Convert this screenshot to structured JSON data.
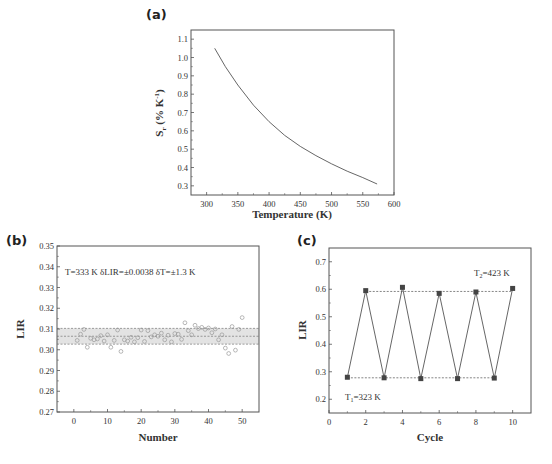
{
  "chart_data": [
    {
      "panel": "(a)",
      "type": "line",
      "title": "",
      "xlabel": "Temperature (K)",
      "ylabel": "S_r (% K^-1)",
      "xlim": [
        275,
        600
      ],
      "ylim": [
        0.25,
        1.15
      ],
      "xticks": [
        300,
        350,
        400,
        450,
        500,
        550,
        600
      ],
      "yticks": [
        0.3,
        0.4,
        0.5,
        0.6,
        0.7,
        0.8,
        0.9,
        1.0,
        1.1
      ],
      "grid": false,
      "series": [
        {
          "name": "Sr",
          "x": [
            313,
            330,
            350,
            375,
            400,
            425,
            450,
            475,
            500,
            525,
            550,
            573
          ],
          "values": [
            1.05,
            0.95,
            0.85,
            0.74,
            0.65,
            0.575,
            0.515,
            0.465,
            0.42,
            0.38,
            0.345,
            0.31
          ]
        }
      ]
    },
    {
      "panel": "(b)",
      "type": "scatter",
      "title": "",
      "xlabel": "Number",
      "ylabel": "LIR",
      "xlim": [
        -5,
        55
      ],
      "ylim": [
        0.27,
        0.35
      ],
      "xticks": [
        0,
        10,
        20,
        30,
        40,
        50
      ],
      "yticks": [
        0.27,
        0.28,
        0.29,
        0.3,
        0.31,
        0.32,
        0.33,
        0.34,
        0.35
      ],
      "grid": false,
      "annotation": "T=333 K δLIR=±0.0038 δT=±1.3 K",
      "band": {
        "mean": 0.3065,
        "upper": 0.3103,
        "lower": 0.3027
      },
      "series": [
        {
          "name": "LIR",
          "x": [
            1,
            2,
            3,
            4,
            5,
            6,
            7,
            8,
            9,
            10,
            11,
            12,
            13,
            14,
            15,
            16,
            17,
            18,
            19,
            20,
            21,
            22,
            23,
            24,
            25,
            26,
            27,
            28,
            29,
            30,
            31,
            32,
            33,
            34,
            35,
            36,
            37,
            38,
            39,
            40,
            41,
            42,
            43,
            44,
            45,
            46,
            47,
            48,
            49,
            50
          ],
          "values": [
            0.3045,
            0.3075,
            0.3098,
            0.3012,
            0.3055,
            0.3048,
            0.3052,
            0.3068,
            0.3042,
            0.3072,
            0.3012,
            0.3045,
            0.3095,
            0.2992,
            0.3048,
            0.3042,
            0.306,
            0.3038,
            0.3058,
            0.3095,
            0.304,
            0.3092,
            0.3062,
            0.3072,
            0.3065,
            0.308,
            0.3048,
            0.307,
            0.3038,
            0.3078,
            0.3075,
            0.305,
            0.313,
            0.3092,
            0.3072,
            0.3118,
            0.3102,
            0.3108,
            0.3098,
            0.3105,
            0.3082,
            0.31,
            0.3048,
            0.3072,
            0.3008,
            0.2982,
            0.3112,
            0.2998,
            0.3098,
            0.3155
          ]
        }
      ]
    },
    {
      "panel": "(c)",
      "type": "line",
      "title": "",
      "xlabel": "Cycle",
      "ylabel": "LIR",
      "xlim": [
        0,
        11
      ],
      "ylim": [
        0.15,
        0.75
      ],
      "xticks": [
        0,
        2,
        4,
        6,
        8,
        10
      ],
      "yticks": [
        0.2,
        0.3,
        0.4,
        0.5,
        0.6,
        0.7
      ],
      "grid": false,
      "annotations": [
        "T2=423 K",
        "T1=323 K"
      ],
      "reference_lines": [
        0.592,
        0.278
      ],
      "series": [
        {
          "name": "LIR cycling",
          "x": [
            1,
            2,
            3,
            4,
            5,
            6,
            7,
            8,
            9,
            10
          ],
          "values": [
            0.28,
            0.595,
            0.278,
            0.607,
            0.275,
            0.585,
            0.275,
            0.59,
            0.277,
            0.603
          ]
        }
      ]
    }
  ],
  "panels": {
    "a": {
      "label": "(a)",
      "xlabel": "Temperature (K)",
      "ylabel_main": "S",
      "ylabel_sub": "r",
      "ylabel_rest": " (% K",
      "ylabel_sup": "-1",
      "ylabel_close": ")",
      "xticks": [
        "300",
        "350",
        "400",
        "450",
        "500",
        "550",
        "600"
      ],
      "yticks": [
        "0.3",
        "0.4",
        "0.5",
        "0.6",
        "0.7",
        "0.8",
        "0.9",
        "1.0",
        "1.1"
      ]
    },
    "b": {
      "label": "(b)",
      "xlabel": "Number",
      "ylabel": "LIR",
      "annotation": "T=333 K δLIR=±0.0038 δT=±1.3 K",
      "xticks": [
        "0",
        "10",
        "20",
        "30",
        "40",
        "50"
      ],
      "yticks": [
        "0.27",
        "0.28",
        "0.29",
        "0.30",
        "0.31",
        "0.32",
        "0.33",
        "0.34",
        "0.35"
      ]
    },
    "c": {
      "label": "(c)",
      "xlabel": "Cycle",
      "ylabel": "LIR",
      "t2_main": "T",
      "t2_sub": "2",
      "t2_rest": "=423 K",
      "t1_main": "T",
      "t1_sub": "1",
      "t1_rest": "=323 K",
      "xticks": [
        "0",
        "2",
        "4",
        "6",
        "8",
        "10"
      ],
      "yticks": [
        "0.2",
        "0.3",
        "0.4",
        "0.5",
        "0.6",
        "0.7"
      ]
    }
  },
  "colors": {
    "axis": "#555555",
    "line": "#555555",
    "marker_c": "#444444",
    "scatter_marker": "#9a9a9a",
    "band_fill": "#e3e3e3",
    "dashed": "#666666"
  }
}
